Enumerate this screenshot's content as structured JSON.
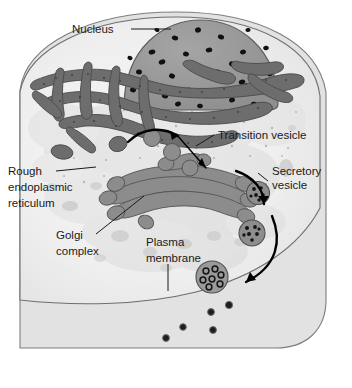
{
  "figure": {
    "background_color": "#ffffff"
  },
  "colors": {
    "extracellular": "#e0e0e0",
    "cytoplasm": "#f2f2f2",
    "cytoplasm_shade": "#dcdcdc",
    "nucleus_fill": "#9a9a9a",
    "nucleus_pore": "#121212",
    "membrane_dark": "#6e6e6e",
    "er_fill": "#6f6f6f",
    "golgi_fill": "#8a8a8a",
    "vesicle_fill": "#8f8f8f",
    "granule": "#1a1a1a",
    "outline": "#4a4a4a",
    "label_text": "#1a1a1a",
    "arrow": "#000000"
  },
  "labels": [
    {
      "id": "nucleus",
      "lines": [
        "Nucleus"
      ],
      "x": 72,
      "y": 33,
      "anchor": "start",
      "leader": "M 131 29 L 171 29"
    },
    {
      "id": "transition-vesicle",
      "lines": [
        "Transition vesicle"
      ],
      "x": 218,
      "y": 139,
      "anchor": "start",
      "leader": "M 196 146 L 214 135"
    },
    {
      "id": "secretory-vesicle",
      "lines": [
        "Secretory",
        "vesicle"
      ],
      "x": 272,
      "y": 175,
      "anchor": "start",
      "leader": "M 268 181 L 258 173"
    },
    {
      "id": "rough-er",
      "lines": [
        "Rough",
        "endoplasmic",
        "reticulum"
      ],
      "x": 8,
      "y": 175,
      "anchor": "start",
      "leader": "M 56 171 L 96 167"
    },
    {
      "id": "golgi-complex",
      "lines": [
        "Golgi",
        "complex"
      ],
      "x": 56,
      "y": 239,
      "anchor": "start",
      "leader": "M 96 234 L 144 196"
    },
    {
      "id": "plasma-membrane",
      "lines": [
        "Plasma",
        "membrane"
      ],
      "x": 146,
      "y": 246,
      "anchor": "start",
      "leader": "M 168 264 L 168 291"
    }
  ],
  "structures": {
    "nucleus": {
      "name": "Nucleus",
      "pore_count": 31
    },
    "rough_er": {
      "name": "Rough endoplasmic reticulum"
    },
    "golgi": {
      "name": "Golgi complex"
    },
    "transition_vesicles": {
      "name": "Transition vesicle",
      "count": 3
    },
    "secretory_vesicles": {
      "name": "Secretory vesicle",
      "count": 3
    },
    "released_granules": {
      "name": "Released secretory granules",
      "count": 5
    }
  }
}
